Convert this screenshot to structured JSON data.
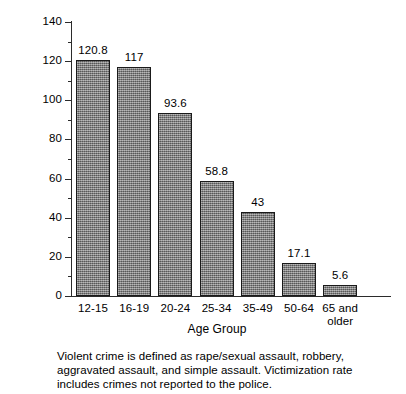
{
  "chart_data": {
    "type": "bar",
    "title": "",
    "xlabel": "Age Group",
    "ylabel": "Victimizations per 1,000",
    "categories": [
      "12-15",
      "16-19",
      "20-24",
      "25-34",
      "35-49",
      "50-64",
      "65 and\nolder"
    ],
    "values": [
      120.8,
      117,
      93.6,
      58.8,
      43,
      17.1,
      5.6
    ],
    "value_labels": [
      "120.8",
      "117",
      "93.6",
      "58.8",
      "43",
      "17.1",
      "5.6"
    ],
    "ylim": [
      0,
      140
    ],
    "yticks": [
      0,
      20,
      40,
      60,
      80,
      100,
      120,
      140
    ],
    "ytick_labels": [
      "0",
      "20",
      "40",
      "60",
      "80",
      "100",
      "120",
      "140"
    ],
    "yminor_interval": 10,
    "grid": false,
    "legend": false,
    "bar_color": "#7d7d7d",
    "bar_edge_color": "#1a1a1a",
    "axis_color": "#2b2b2b"
  },
  "footnote": {
    "text": "Violent crime is defined as rape/sexual assault, robbery, aggravated assault, and simple assault. Victimization rate includes crimes not reported to the police."
  }
}
